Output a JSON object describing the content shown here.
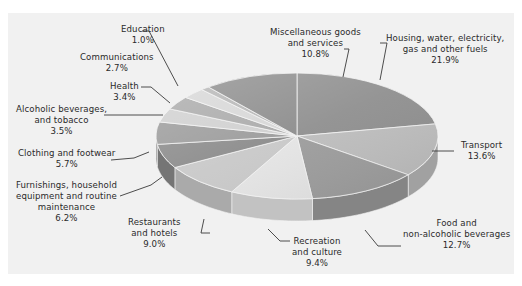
{
  "chart_data": {
    "type": "pie",
    "style": "3d-exploded-none",
    "title": "",
    "unit": "%",
    "slices": [
      {
        "label": "Housing, water, electricity, gas and other fuels",
        "value": 21.9
      },
      {
        "label": "Transport",
        "value": 13.6
      },
      {
        "label": "Food and non-alcoholic beverages",
        "value": 12.7
      },
      {
        "label": "Recreation and culture",
        "value": 9.4
      },
      {
        "label": "Restaurants and hotels",
        "value": 9.0
      },
      {
        "label": "Furnishings, household equipment and routine maintenance",
        "value": 6.2
      },
      {
        "label": "Clothing and footwear",
        "value": 5.7
      },
      {
        "label": "Alcoholic beverages, and tobacco",
        "value": 3.5
      },
      {
        "label": "Health",
        "value": 3.4
      },
      {
        "label": "Communications",
        "value": 2.7
      },
      {
        "label": "Education",
        "value": 1.0
      },
      {
        "label": "Miscellaneous goods and services",
        "value": 10.8
      }
    ],
    "legend": "none (callout labels)",
    "start_angle_deg": 0,
    "direction": "clockwise"
  },
  "labels": {
    "housing": {
      "lines": [
        "Housing, water, electricity,",
        "gas and other fuels"
      ],
      "pct": "21.9%"
    },
    "transport": {
      "lines": [
        "Transport"
      ],
      "pct": "13.6%"
    },
    "food": {
      "lines": [
        "Food and",
        "non-alcoholic beverages"
      ],
      "pct": "12.7%"
    },
    "recreation": {
      "lines": [
        "Recreation",
        "and culture"
      ],
      "pct": "9.4%"
    },
    "restaurants": {
      "lines": [
        "Restaurants",
        "and hotels"
      ],
      "pct": "9.0%"
    },
    "furnishings": {
      "lines": [
        "Furnishings,  household",
        "equipment and routine",
        "maintenance"
      ],
      "pct": "6.2%"
    },
    "clothing": {
      "lines": [
        "Clothing and footwear"
      ],
      "pct": "5.7%"
    },
    "alcohol": {
      "lines": [
        "Alcoholic beverages,",
        "and tobacco"
      ],
      "pct": "3.5%"
    },
    "health": {
      "lines": [
        "Health"
      ],
      "pct": "3.4%"
    },
    "communications": {
      "lines": [
        "Communications"
      ],
      "pct": "2.7%"
    },
    "education": {
      "lines": [
        "Education"
      ],
      "pct": "1.0%"
    },
    "misc": {
      "lines": [
        "Miscellaneous goods",
        "and services"
      ],
      "pct": "10.8%"
    }
  },
  "colors": {
    "panel": "#f1f1f1",
    "text": "#2a2a2a",
    "leader": "#3a3a3a",
    "slice_shades": [
      "#8f8f8f",
      "#bdbdbd",
      "#9c9c9c",
      "#e4e4e4",
      "#c8c8c8",
      "#8a8a8a",
      "#9a9a9a",
      "#cfcfcf",
      "#a9a9a9",
      "#d6d6d6",
      "#b5b5b5",
      "#8c8c8c"
    ]
  }
}
